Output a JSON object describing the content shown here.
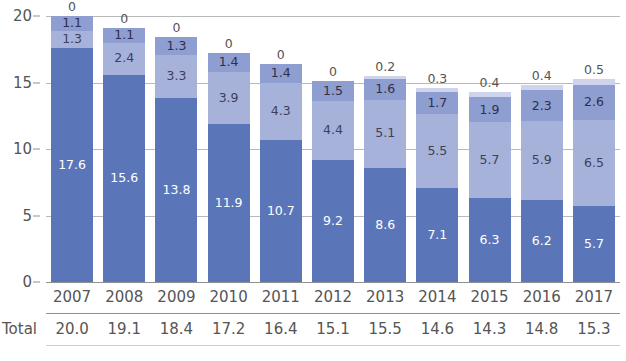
{
  "title": "(cropped title)",
  "axis": {
    "y_ticks": [
      "0",
      "5",
      "10",
      "15",
      "20"
    ],
    "y_min": 0,
    "y_max": 20,
    "x_label": "",
    "y_label": ""
  },
  "totals_row": {
    "label": "Total",
    "values": [
      "20.0",
      "19.1",
      "18.4",
      "17.2",
      "16.4",
      "15.1",
      "15.5",
      "14.6",
      "14.3",
      "14.8",
      "15.3"
    ]
  },
  "colors": {
    "series_0": "#5b76b8",
    "series_1": "#a7b2da",
    "series_2": "#8e9ed0",
    "series_3": "#cdd4ec",
    "grid": "#b9b9b9",
    "axis": "#8f8f8f",
    "text": "#555555",
    "title": "#3b3b7a"
  },
  "chart_data": {
    "type": "bar",
    "stacked": true,
    "title": "(cropped title)",
    "xlabel": "",
    "ylabel": "",
    "ylim": [
      0,
      20
    ],
    "yticks": [
      0,
      5,
      10,
      15,
      20
    ],
    "grid": true,
    "legend": "none",
    "categories": [
      "2007",
      "2008",
      "2009",
      "2010",
      "2011",
      "2012",
      "2013",
      "2014",
      "2015",
      "2016",
      "2017"
    ],
    "series": [
      {
        "name": "series-1-base",
        "color": "#5b76b8",
        "values": [
          17.6,
          15.6,
          13.8,
          11.9,
          10.7,
          9.2,
          8.6,
          7.1,
          6.3,
          6.2,
          5.7
        ],
        "labels": [
          "17.6",
          "15.6",
          "13.8",
          "11.9",
          "10.7",
          "9.2",
          "8.6",
          "7.1",
          "6.3",
          "6.2",
          "5.7"
        ]
      },
      {
        "name": "series-2-middle",
        "color": "#a7b2da",
        "values": [
          1.3,
          2.4,
          3.3,
          3.9,
          4.3,
          4.4,
          5.1,
          5.5,
          5.7,
          5.9,
          6.5
        ],
        "labels": [
          "1.3",
          "2.4",
          "3.3",
          "3.9",
          "4.3",
          "4.4",
          "5.1",
          "5.5",
          "5.7",
          "5.9",
          "6.5"
        ]
      },
      {
        "name": "series-3-upper",
        "color": "#8e9ed0",
        "values": [
          1.1,
          1.1,
          1.3,
          1.4,
          1.4,
          1.5,
          1.6,
          1.7,
          1.9,
          2.3,
          2.6
        ],
        "labels": [
          "1.1",
          "1.1",
          "1.3",
          "1.4",
          "1.4",
          "1.5",
          "1.6",
          "1.7",
          "1.9",
          "2.3",
          "2.6"
        ]
      },
      {
        "name": "series-4-top",
        "color": "#cdd4ec",
        "values": [
          0,
          0,
          0,
          0,
          0,
          0,
          0.2,
          0.3,
          0.4,
          0.4,
          0.5
        ],
        "labels": [
          "0",
          "0",
          "0",
          "0",
          "0",
          "0",
          "0.2",
          "0.3",
          "0.4",
          "0.4",
          "0.5"
        ]
      }
    ],
    "totals": [
      20.0,
      19.1,
      18.4,
      17.2,
      16.4,
      15.1,
      15.5,
      14.6,
      14.3,
      14.8,
      15.3
    ],
    "totals_label": "Total"
  }
}
